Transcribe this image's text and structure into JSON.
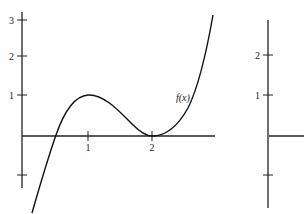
{
  "left_plot": {
    "curve_label": "f(x)",
    "y_tick_labels": [
      "3",
      "2",
      "1"
    ],
    "x_tick_labels": [
      "1",
      "2"
    ]
  },
  "right_plot": {
    "y_tick_labels": [
      "2",
      "1"
    ]
  },
  "colors": {
    "axis": "#222222",
    "curve": "#111111",
    "background": "#ffffff"
  }
}
